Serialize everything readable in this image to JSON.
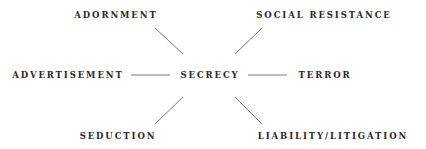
{
  "diagram": {
    "type": "radial-concept-map",
    "center": {
      "label": "SECRECY",
      "x": 210,
      "y": 75
    },
    "nodes": [
      {
        "id": "adornment",
        "label": "ADORNMENT",
        "x": 116,
        "y": 15
      },
      {
        "id": "social-resistance",
        "label": "SOCIAL RESISTANCE",
        "x": 324,
        "y": 15
      },
      {
        "id": "advertisement",
        "label": "ADVERTISEMENT",
        "x": 68,
        "y": 75
      },
      {
        "id": "terror",
        "label": "TERROR",
        "x": 325,
        "y": 75
      },
      {
        "id": "seduction",
        "label": "SEDUCTION",
        "x": 118,
        "y": 136
      },
      {
        "id": "liability-litigation",
        "label": "LIABILITY/LITIGATION",
        "x": 333,
        "y": 136
      }
    ],
    "edges": [
      {
        "from": "secrecy",
        "to": "adornment",
        "x1": 155,
        "y1": 28,
        "x2": 183,
        "y2": 54
      },
      {
        "from": "secrecy",
        "to": "social-resistance",
        "x1": 262,
        "y1": 28,
        "x2": 235,
        "y2": 54
      },
      {
        "from": "secrecy",
        "to": "advertisement",
        "x1": 131,
        "y1": 75,
        "x2": 170,
        "y2": 75
      },
      {
        "from": "secrecy",
        "to": "terror",
        "x1": 248,
        "y1": 75,
        "x2": 287,
        "y2": 75
      },
      {
        "from": "secrecy",
        "to": "seduction",
        "x1": 183,
        "y1": 97,
        "x2": 155,
        "y2": 124
      },
      {
        "from": "secrecy",
        "to": "liability-litigation",
        "x1": 235,
        "y1": 97,
        "x2": 262,
        "y2": 124
      }
    ],
    "colors": {
      "text": "#2a2a2a",
      "line": "#555555",
      "background": "#ffffff"
    }
  }
}
